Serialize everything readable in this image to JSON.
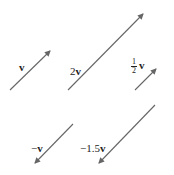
{
  "diagram": {
    "colors": {
      "arrow": "#666666",
      "text": "#222222",
      "background": "#ffffff"
    },
    "arrows": [
      {
        "id": "v",
        "scalar": 1,
        "label": "v",
        "x1": 10,
        "y1": 90,
        "x2": 50,
        "y2": 51
      },
      {
        "id": "2v",
        "scalar": 2,
        "label": "2v",
        "x1": 68,
        "y1": 90,
        "x2": 143,
        "y2": 14
      },
      {
        "id": "half_v",
        "scalar": 0.5,
        "label": "1/2 v",
        "x1": 135,
        "y1": 90,
        "x2": 156,
        "y2": 69
      },
      {
        "id": "neg_v",
        "scalar": -1,
        "label": "−v",
        "x1": 73,
        "y1": 124,
        "x2": 35,
        "y2": 163
      },
      {
        "id": "neg_1_5v",
        "scalar": -1.5,
        "label": "−1.5v",
        "x1": 155,
        "y1": 105,
        "x2": 99,
        "y2": 163
      }
    ],
    "labels": {
      "v": {
        "prefix": "",
        "bold": "v"
      },
      "two_v": {
        "prefix": "2",
        "bold": "v"
      },
      "half_v": {
        "num": "1",
        "den": "2",
        "bold": "v"
      },
      "neg_v": {
        "prefix": "−",
        "bold": "v"
      },
      "neg_1_5v": {
        "prefix": "−1.5",
        "bold": "v"
      }
    }
  }
}
